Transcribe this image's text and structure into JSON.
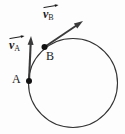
{
  "figure": {
    "type": "physics-diagram",
    "width": 125,
    "height": 134,
    "background_color": "#fdfdfd",
    "stroke_color": "#333333",
    "text_color": "#1a1a1a"
  },
  "labels": {
    "point_a": "A",
    "point_b": "B",
    "vector_a_base": "v",
    "vector_a_sub": "A",
    "vector_b_base": "v",
    "vector_b_sub": "B"
  },
  "chart_data": {
    "type": "scatter",
    "title": "",
    "xlabel": "",
    "ylabel": "",
    "circle": {
      "center_x": 73,
      "center_y": 83,
      "radius": 44.5,
      "stroke_width": 1.1
    },
    "points": [
      {
        "name": "A",
        "x": 29,
        "y": 81,
        "radius": 3.0
      },
      {
        "name": "B",
        "x": 44.5,
        "y": 47,
        "radius": 3.0
      }
    ],
    "vectors": [
      {
        "name": "v_A",
        "from_x": 29,
        "from_y": 81,
        "to_x": 31,
        "to_y": 36,
        "head_length": 9,
        "head_width": 6
      },
      {
        "name": "v_B",
        "from_x": 44.5,
        "from_y": 47,
        "to_x": 83,
        "to_y": 21,
        "head_length": 9,
        "head_width": 6
      }
    ]
  }
}
